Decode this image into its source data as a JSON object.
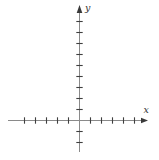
{
  "figure": {
    "background_color": "#ffffff",
    "axis_color": "#8a8a8a",
    "tick_color": "#3f3f3f",
    "arrow_color": "#3a3a3a",
    "label_color": "#333333",
    "origin_px": {
      "x": 79.5,
      "y": 120.5
    },
    "tick_spacing_px": 11,
    "tick_half_length_px": 3.2,
    "x_axis": {
      "label": "x",
      "ticks_left_of_origin": 5,
      "ticks_right_of_origin": 5,
      "line_start_px": 8,
      "arrow_tip_px": 148,
      "arrow_direction": "right"
    },
    "y_axis": {
      "label": "y",
      "ticks_above_origin": 9,
      "ticks_below_origin": 2,
      "line_bottom_px": 152,
      "arrow_tip_px": 5,
      "arrow_direction": "up"
    }
  }
}
